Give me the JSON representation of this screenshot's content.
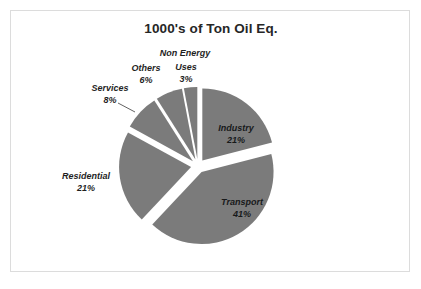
{
  "chart_data": {
    "type": "pie",
    "title": "1000's of Ton Oil Eq.",
    "categories": [
      "Industry",
      "Transport",
      "Residential",
      "Services",
      "Others",
      "Non Energy Uses"
    ],
    "values": [
      21,
      41,
      21,
      8,
      6,
      3
    ],
    "value_labels": [
      "21%",
      "41%",
      "21%",
      "8%",
      "6%",
      "3%"
    ],
    "unit": "percent",
    "legend": "none",
    "slice_color": "#7b7b7b",
    "label_color": "#1f1f1f",
    "title_color": "#262626",
    "background": "#ffffff",
    "border_color": "#dcdcdc",
    "exploded": true,
    "labels_placement": {
      "Industry": "inside",
      "Transport": "inside",
      "Residential": "outside",
      "Services": "outside-with-leader",
      "Others": "outside",
      "Non Energy Uses": "outside"
    }
  },
  "labels": {
    "industry": {
      "name": "Industry",
      "pct": "21%"
    },
    "transport": {
      "name": "Transport",
      "pct": "41%"
    },
    "residential": {
      "name": "Residential",
      "pct": "21%"
    },
    "services": {
      "name": "Services",
      "pct": "8%"
    },
    "others": {
      "name": "Others",
      "pct": "6%"
    },
    "non_energy": {
      "name_line1": "Non Energy",
      "name_line2": "Uses",
      "pct": "3%"
    }
  }
}
